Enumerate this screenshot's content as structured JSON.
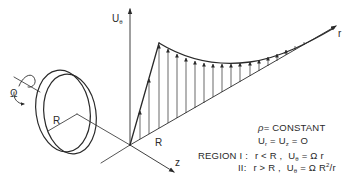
{
  "diagram": {
    "colors": {
      "ink": "#2a2a2a",
      "background": "#ffffff"
    },
    "axes": {
      "vertical": {
        "label": "U",
        "subscript": "θ"
      },
      "radial": {
        "label": "r"
      },
      "axial": {
        "label": "z"
      }
    },
    "disk": {
      "rotation_label": "Ω",
      "radius_label": "R",
      "rotation_icon": "curved-arrow"
    },
    "profile_radius_label": "R",
    "conditions": {
      "density": {
        "symbol": "ρ",
        "text": "= CONSTANT"
      },
      "velocities": {
        "u": "U",
        "r_sub": "r",
        "eq1": " = ",
        "z_sub": "z",
        "eq2": " = O"
      },
      "region1": {
        "prefix": "REGION  I :",
        "cond": "r < R ,",
        "u": "U",
        "sub": "θ",
        "rhs": " = Ω r"
      },
      "region2": {
        "prefix": "II:",
        "cond": "r > R ,",
        "u": "U",
        "sub": "θ",
        "rhs_a": " = Ω R",
        "sup": "2",
        "rhs_b": "/r"
      }
    }
  }
}
